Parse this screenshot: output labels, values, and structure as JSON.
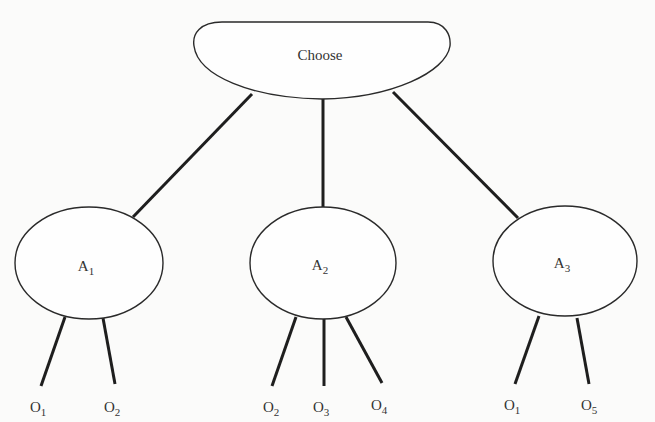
{
  "diagram": {
    "type": "decision-tree",
    "root": {
      "label": "Choose"
    },
    "alternatives": [
      {
        "id": "A1",
        "base": "A",
        "sub": "1",
        "outcomes": [
          {
            "base": "O",
            "sub": "1"
          },
          {
            "base": "O",
            "sub": "2"
          }
        ]
      },
      {
        "id": "A2",
        "base": "A",
        "sub": "2",
        "outcomes": [
          {
            "base": "O",
            "sub": "2"
          },
          {
            "base": "O",
            "sub": "3"
          },
          {
            "base": "O",
            "sub": "4"
          }
        ]
      },
      {
        "id": "A3",
        "base": "A",
        "sub": "3",
        "outcomes": [
          {
            "base": "O",
            "sub": "1"
          },
          {
            "base": "O",
            "sub": "5"
          }
        ]
      }
    ],
    "colors": {
      "stroke": "#1e1e1e",
      "background": "#fbfbfa",
      "text": "#333333"
    }
  }
}
